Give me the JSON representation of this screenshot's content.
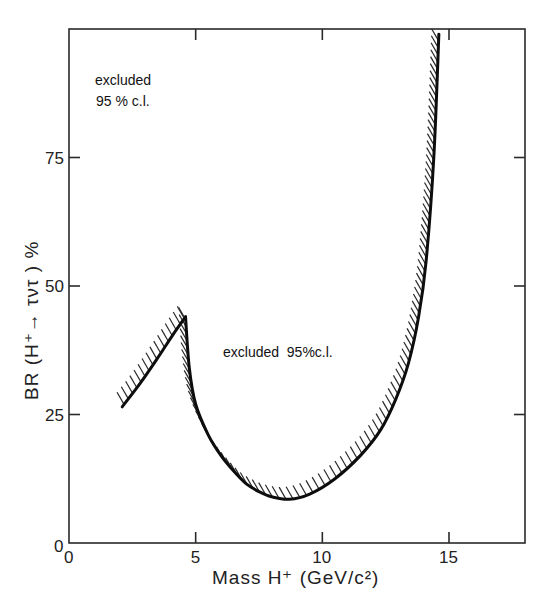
{
  "chart_data": {
    "type": "line",
    "title": "",
    "xlabel": "Mass H⁺ (GeV/c²)",
    "ylabel": "BR (H⁺→ τ ντ) %",
    "xlim": [
      0,
      18
    ],
    "ylim": [
      0,
      100
    ],
    "x_ticks": [
      0,
      5,
      10,
      15
    ],
    "x_tick_labels": [
      "0",
      "5",
      "10",
      "15"
    ],
    "y_ticks": [
      0,
      25,
      50,
      75
    ],
    "y_tick_labels": [
      "0",
      "25",
      "50",
      "75"
    ],
    "grid": false,
    "legend": null,
    "series": [
      {
        "name": "95% c.l. exclusion boundary (low-mass branch)",
        "hatched_side": "above",
        "x": [
          2.1,
          2.8,
          3.5,
          4.1,
          4.6
        ],
        "y": [
          26.5,
          31,
          36,
          40.5,
          44
        ]
      },
      {
        "name": "95% c.l. exclusion boundary (main branch)",
        "hatched_side": "above",
        "x": [
          4.6,
          4.75,
          5.0,
          5.5,
          6.0,
          6.5,
          7.0,
          7.5,
          8.0,
          8.7,
          9.5,
          10.5,
          11.5,
          12.3,
          12.9,
          13.4,
          13.8,
          14.1,
          14.4,
          14.6
        ],
        "y": [
          44,
          34,
          27,
          21,
          17,
          14,
          11.5,
          10,
          9,
          8.5,
          9.5,
          12.5,
          17,
          22,
          28,
          35,
          44,
          55,
          75,
          99
        ]
      }
    ],
    "annotations": [
      {
        "text_line1": "excluded",
        "text_line2": "95 % c.l.",
        "x": 1.0,
        "y": 90
      },
      {
        "text": "excluded  95%c.l.",
        "x": 5.7,
        "y": 44
      }
    ]
  },
  "labels": {
    "annot_top_1": "excluded",
    "annot_top_2": "95 % c.l.",
    "annot_mid": "excluded  95%c.l.",
    "x_title": "Mass H⁺ (GeV/c²)",
    "y_title": "BR (H⁺→ τντ ) %",
    "x0": "0",
    "y0": "0"
  }
}
